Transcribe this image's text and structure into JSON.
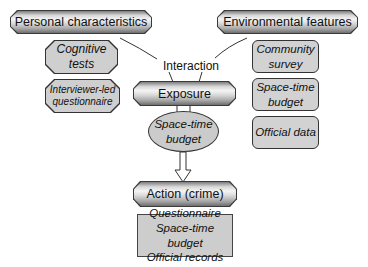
{
  "diagram": {
    "top_left": {
      "label": "Personal characteristics"
    },
    "top_right": {
      "label": "Environmental features"
    },
    "personal_measures": [
      {
        "line1": "Cognitive",
        "line2": "tests"
      },
      {
        "line1": "Interviewer-led",
        "line2": "questionnaire"
      }
    ],
    "environmental_measures": [
      {
        "line1": "Community",
        "line2": "survey"
      },
      {
        "line1": "Space-time",
        "line2": "budget"
      },
      {
        "line1": "Official data",
        "line2": ""
      }
    ],
    "interaction_label": "Interaction",
    "exposure": {
      "label": "Exposure"
    },
    "exposure_measure": {
      "line1": "Space-time",
      "line2": "budget"
    },
    "action": {
      "label": "Action (crime)"
    },
    "action_measures": [
      "Questionnaire",
      "Space-time budget",
      "Official records"
    ],
    "colors": {
      "box_fill": "#d0d0d0",
      "border": "#333333",
      "background": "#ffffff"
    }
  }
}
